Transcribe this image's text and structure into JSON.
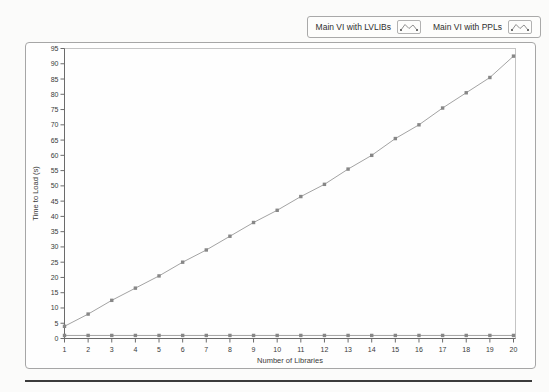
{
  "chart_data": {
    "type": "line",
    "x": [
      1,
      2,
      3,
      4,
      5,
      6,
      7,
      8,
      9,
      10,
      11,
      12,
      13,
      14,
      15,
      16,
      17,
      18,
      19,
      20
    ],
    "series": [
      {
        "name": "Main VI with LVLIBs",
        "values": [
          4,
          8,
          12.5,
          16.5,
          20.5,
          25,
          29,
          33.5,
          38,
          42,
          46.5,
          50.5,
          55.5,
          60,
          65.5,
          70,
          75.5,
          80.5,
          85.5,
          92.5
        ],
        "color": "#a3a3a3",
        "marker_color": "#878787",
        "marker": "square"
      },
      {
        "name": "Main VI with PPLs",
        "values": [
          1,
          1,
          1,
          1,
          1,
          1,
          1,
          1,
          1,
          1,
          1,
          1,
          1,
          1,
          1,
          1,
          1,
          1,
          1,
          1
        ],
        "color": "#a3a3a3",
        "marker_color": "#878787",
        "marker": "square"
      }
    ],
    "xlabel": "Number of Libraries",
    "ylabel": "Time to Load (s)",
    "xlim": [
      1,
      20
    ],
    "ylim": [
      0,
      95
    ],
    "ytick_step": 5,
    "xtick_step": 1,
    "grid": false,
    "legend_position": "top-right"
  },
  "colors": {
    "axis": "#6b6b6b",
    "plot_border": "#c4c4c4",
    "tick_text": "#3a3a3a",
    "frame_border": "#a6a6a6",
    "bottom_rule": "#3b3b3b"
  }
}
